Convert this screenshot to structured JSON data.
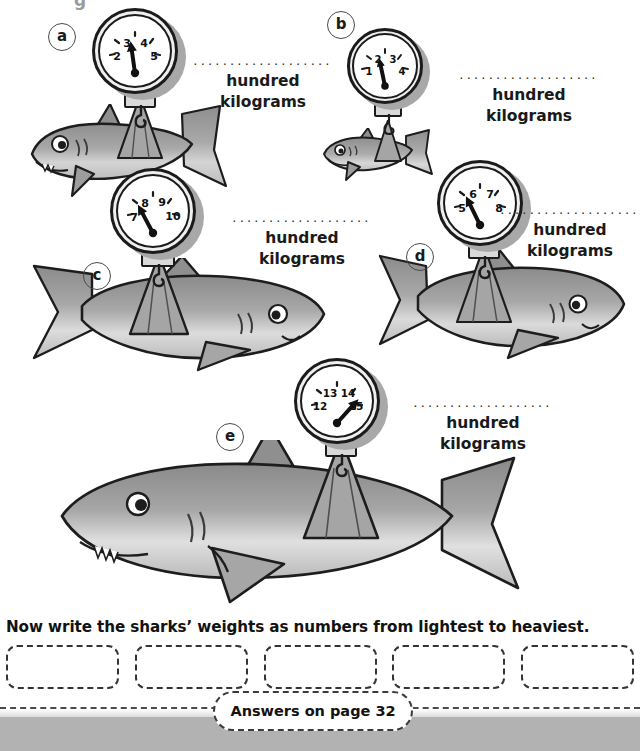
{
  "page": {
    "background_color": "#ffffff",
    "bottom_band_color": "#b2b2b2",
    "ink_color": "#1a1a1a",
    "shark_fill": "#9a9a9a",
    "top_cut_text": "g"
  },
  "scales": [
    {
      "id": "a",
      "letter": "a",
      "dial": {
        "numbers": [
          "2",
          "3",
          "4",
          "5"
        ],
        "needle_value": "4",
        "needle_angle_deg": -8
      },
      "label": {
        "dots": "...................",
        "line1": "hundred",
        "line2": "kilograms"
      },
      "shark_size": "small-medium",
      "shark_facing": "left"
    },
    {
      "id": "b",
      "letter": "b",
      "dial": {
        "numbers": [
          "1",
          "2",
          "3",
          "4"
        ],
        "needle_value": "2",
        "needle_angle_deg": -12
      },
      "label": {
        "dots": "...................",
        "line1": "hundred",
        "line2": "kilograms"
      },
      "shark_size": "smallest",
      "shark_facing": "left"
    },
    {
      "id": "c",
      "letter": "c",
      "dial": {
        "numbers": [
          "7",
          "8",
          "9",
          "10"
        ],
        "needle_value": "8",
        "needle_angle_deg": -28
      },
      "label": {
        "dots": "...................",
        "line1": "hundred",
        "line2": "kilograms"
      },
      "shark_size": "large",
      "shark_facing": "right"
    },
    {
      "id": "d",
      "letter": "d",
      "dial": {
        "numbers": [
          "5",
          "6",
          "7",
          "8"
        ],
        "needle_value": "6",
        "needle_angle_deg": -26
      },
      "label": {
        "dots": "...................",
        "line1": "hundred",
        "line2": "kilograms"
      },
      "shark_size": "medium-large",
      "shark_facing": "right"
    },
    {
      "id": "e",
      "letter": "e",
      "dial": {
        "numbers": [
          "12",
          "13",
          "14",
          "15"
        ],
        "needle_value": "15",
        "needle_angle_deg": 42
      },
      "label": {
        "dots": "...................",
        "line1": "hundred",
        "line2": "kilograms"
      },
      "shark_size": "largest",
      "shark_facing": "left"
    }
  ],
  "bottom": {
    "question": "Now write the sharks’ weights as numbers from lightest to heaviest.",
    "answer_boxes": [
      "",
      "",
      "",
      "",
      ""
    ],
    "answers_note": "Answers on page 32"
  }
}
